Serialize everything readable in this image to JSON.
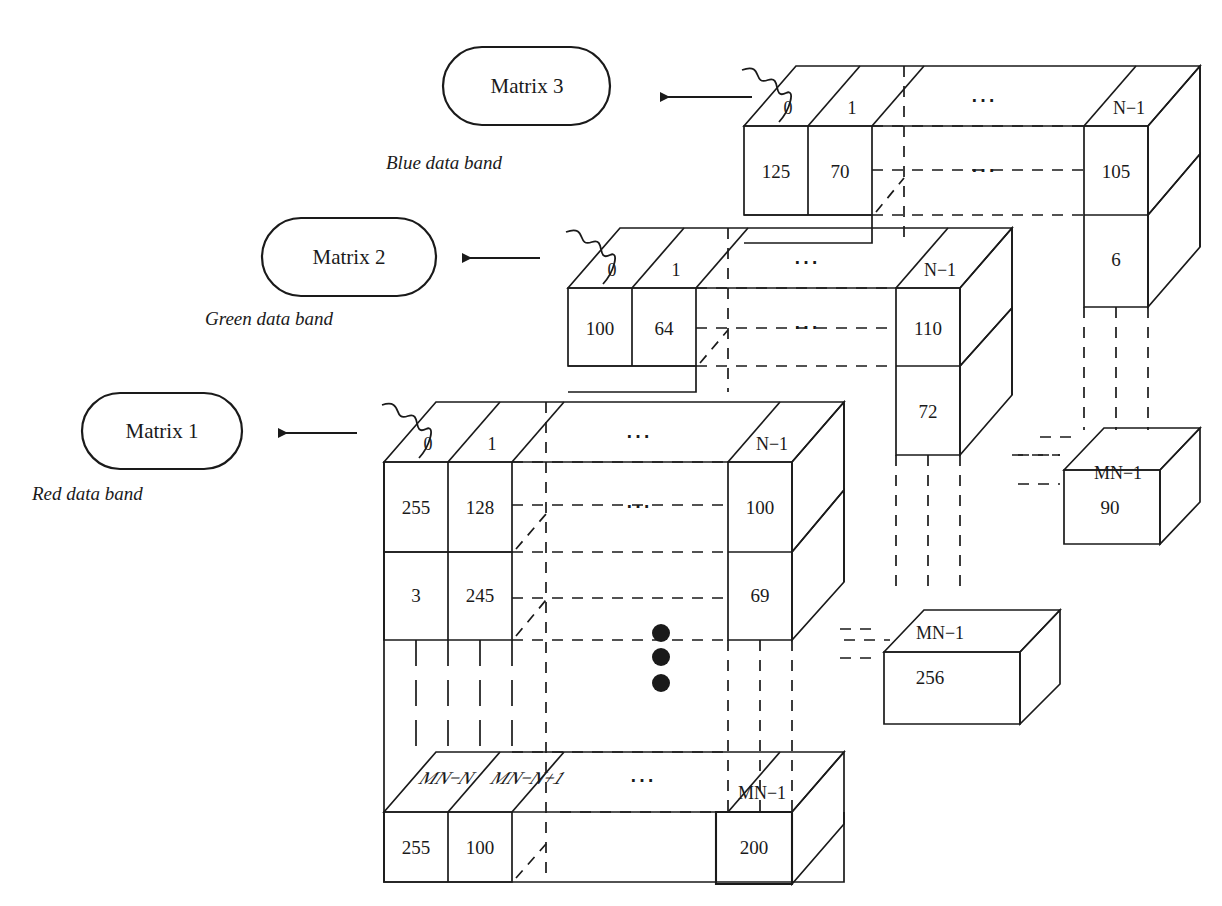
{
  "figure": {
    "type": "diagram"
  },
  "bands": [
    {
      "id": "red",
      "matrix_label": "Matrix 1",
      "band_caption": "Red data band",
      "top_indices": [
        "0",
        "1",
        "⋯",
        "N−1"
      ],
      "bottom_indices": [
        "MN−N",
        "MN−N+1",
        "⋯",
        "MN−1"
      ],
      "front_values_row1": [
        "255",
        "128",
        "⋯",
        "100"
      ],
      "front_values_row2": [
        "3",
        "245",
        "",
        "69"
      ],
      "bottom_values": [
        "255",
        "100",
        "",
        "200"
      ],
      "side_index": "MN−1",
      "side_value": "256"
    },
    {
      "id": "green",
      "matrix_label": "Matrix 2",
      "band_caption": "Green data band",
      "top_indices": [
        "0",
        "1",
        "⋯",
        "N−1"
      ],
      "front_values_row1": [
        "100",
        "64",
        "⋯",
        "110"
      ],
      "front_values_row2": [
        "",
        "",
        "",
        "72"
      ],
      "side_index": "MN−1",
      "side_value": "90"
    },
    {
      "id": "blue",
      "matrix_label": "Matrix 3",
      "band_caption": "Blue data band",
      "top_indices": [
        "0",
        "1",
        "⋯",
        "N−1"
      ],
      "front_values_row1": [
        "125",
        "70",
        "⋯",
        "105"
      ],
      "front_values_row2": [
        "",
        "",
        "",
        "6"
      ]
    }
  ],
  "ellipsis": {
    "horizontal": "⋯",
    "vertical_dots": 3
  },
  "colors": {
    "stroke": "#1a1a1a",
    "background": "#ffffff",
    "text": "#1a1a1a"
  },
  "labels": {
    "matrix1": "Matrix 1",
    "matrix2": "Matrix 2",
    "matrix3": "Matrix 3",
    "red_band": "Red data band",
    "green_band": "Green data band",
    "blue_band": "Blue data band",
    "dots": "⋯",
    "idx_0": "0",
    "idx_1": "1",
    "idx_n_minus_1": "N−1",
    "idx_mn_minus_n": "MN−N",
    "idx_mn_minus_n_plus_1": "MN−N+1",
    "idx_mn_minus_1": "MN−1",
    "v_255": "255",
    "v_128": "128",
    "v_100": "100",
    "v_3": "3",
    "v_245": "245",
    "v_69": "69",
    "v_100b": "100",
    "v_200": "200",
    "v_256": "256",
    "v_100g": "100",
    "v_64": "64",
    "v_110": "110",
    "v_72": "72",
    "v_90": "90",
    "v_125": "125",
    "v_70": "70",
    "v_105": "105",
    "v_6": "6"
  }
}
